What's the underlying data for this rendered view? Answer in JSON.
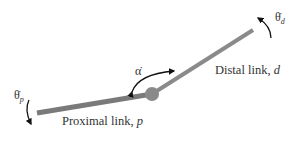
{
  "diagram": {
    "type": "two-link arm",
    "links": [
      {
        "name": "proximal",
        "label": "Proximal link, ",
        "var": "p"
      },
      {
        "name": "distal",
        "label": "Distal link, ",
        "var": "d"
      }
    ],
    "symbols": {
      "theta_p": {
        "base": "θ̇",
        "sub": "p"
      },
      "theta_d": {
        "base": "θ̇",
        "sub": "d"
      },
      "alpha": {
        "base": "α̇"
      }
    },
    "colors": {
      "link": "#7a7a7a",
      "joint": "#8a8a8a",
      "arrow": "#111111",
      "text": "#333333"
    }
  }
}
